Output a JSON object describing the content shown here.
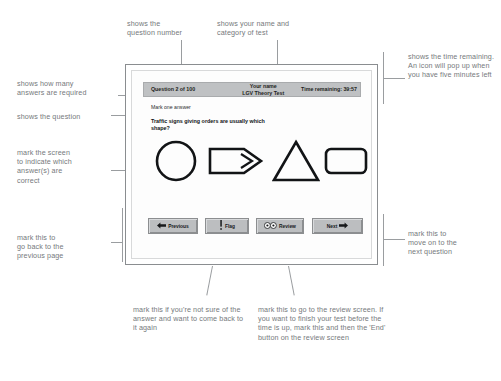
{
  "exam": {
    "header": {
      "question_counter": "Question 2 of 100",
      "name_line1": "Your name",
      "name_line2": "LGV Theory Test",
      "time_remaining": "Time remaining: 39:57"
    },
    "instruction": "Mark one answer",
    "question": "Traffic signs giving orders are usually which shape?",
    "answers": [
      {
        "name": "circle",
        "shape": "circle"
      },
      {
        "name": "arrow",
        "shape": "arrow"
      },
      {
        "name": "triangle",
        "shape": "triangle"
      },
      {
        "name": "rectangle",
        "shape": "rectangle"
      }
    ],
    "buttons": {
      "previous": "Previous",
      "flag": "Flag",
      "review": "Review",
      "next": "Next"
    },
    "icons": {
      "previous": "left-arrow-icon",
      "flag": "exclamation-icon",
      "review": "eyes-icon",
      "next": "right-arrow-icon"
    }
  },
  "annotations": {
    "question_number": "shows the\nquestion number",
    "name_category": "shows your name and\ncategory of test",
    "time": "shows the time remaining. An icon will pop up when you have five minutes left",
    "answers_required": "shows how many\nanswers are required",
    "question": "shows the question",
    "mark_screen": "mark the screen\nto indicate which\nanswer(s) are\ncorrect",
    "previous": "mark this to\ngo back to the\nprevious page",
    "flag": "mark this if you're not sure of the answer and want to come back to it again",
    "review": "mark this to go to the review screen. If you want to finish your test before the time is up, mark this and then the 'End' button on the review screen",
    "next": "mark this to\nmove on to the\nnext question"
  },
  "colors": {
    "header_bar": "#bfc1c3",
    "button_face": "#bcbec0",
    "window_border": "#8a8d90",
    "annotation_text": "#76797c"
  }
}
